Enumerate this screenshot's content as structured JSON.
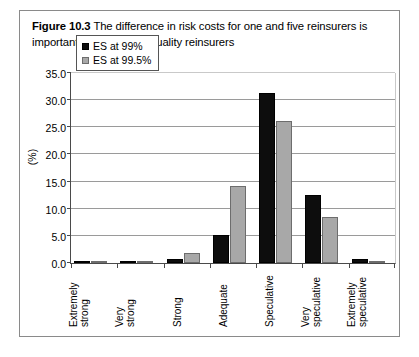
{
  "caption": {
    "figure_label": "Figure 10.3",
    "text": " The difference in risk costs for one and five reinsurers is important only for lower quality reinsurers"
  },
  "chart_data": {
    "type": "bar",
    "title": "",
    "xlabel": "",
    "ylabel": "(%)",
    "ylim": [
      0,
      35
    ],
    "yticks": [
      "0.0",
      "5.0",
      "10.0",
      "15.0",
      "20.0",
      "25.0",
      "30.0",
      "35.0"
    ],
    "grid": true,
    "legend_position": "top-left",
    "categories": [
      "Extremely strong",
      "Very strong",
      "Strong",
      "Adequate",
      "Speculative",
      "Very speculative",
      "Extremely speculative"
    ],
    "series": [
      {
        "name": "ES at 99%",
        "color": "#0d0d0d",
        "values": [
          0.1,
          0.1,
          0.7,
          5.2,
          31.4,
          12.5,
          0.8
        ]
      },
      {
        "name": "ES at 99.5%",
        "color": "#a8a8a8",
        "values": [
          0.15,
          0.2,
          1.9,
          14.2,
          26.2,
          8.5,
          0.4
        ]
      }
    ]
  }
}
